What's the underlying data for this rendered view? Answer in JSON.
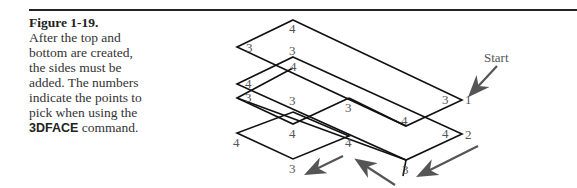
{
  "figure": {
    "title": "Figure 1-19.",
    "caption_text": "After the top and bottom are created, the sides must be added. The numbers indicate the points to pick when using the",
    "command": "3DFACE",
    "caption_end": " command."
  },
  "diagram": {
    "start_label": "Start",
    "labels": [
      "4",
      "3",
      "3",
      "4",
      "4",
      "3",
      "3",
      "3",
      "4",
      "4",
      "3",
      "1",
      "4",
      "2",
      "4",
      "3",
      "3",
      "4",
      "3"
    ],
    "line_color": "#111111",
    "arrow_color": "#555555"
  }
}
